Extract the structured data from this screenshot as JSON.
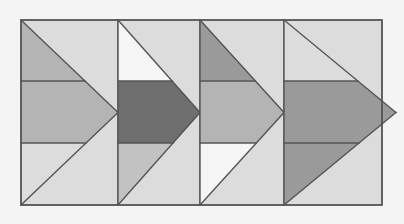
{
  "figure": {
    "canvas": {
      "width": 404,
      "height": 224
    },
    "background_color": "#f4f4f4",
    "stroke_color": "#555555",
    "stroke_width": 1.4,
    "frame": {
      "x": 21,
      "y": 20,
      "width": 361,
      "height": 185
    },
    "band_lines_y": [
      81,
      143
    ],
    "panel_dividers_x": [
      118,
      200,
      284
    ],
    "palette": {
      "white": "#f5f5f5",
      "light": "#dcdcdc",
      "light_mid": "#cccccc",
      "mid": "#b4b4b4",
      "mid_dark": "#9a9a9a",
      "dark": "#6e6e6e"
    }
  },
  "panels": [
    {
      "name": "panel-1",
      "label": "Panel 1",
      "x": 21,
      "width": 97,
      "base_fill": "#dcdcdc",
      "top_fill": "#b4b4b4",
      "middle_fill": "#b4b4b4",
      "bottom_fill": "#dcdcdc",
      "tip_overhang": 0
    },
    {
      "name": "panel-2",
      "label": "Panel 2",
      "x": 118,
      "width": 82,
      "base_fill": "#dcdcdc",
      "top_fill": "#f5f5f5",
      "middle_fill": "#6e6e6e",
      "bottom_fill": "#c2c2c2",
      "tip_overhang": 0
    },
    {
      "name": "panel-3",
      "label": "Panel 3",
      "x": 200,
      "width": 84,
      "base_fill": "#dcdcdc",
      "top_fill": "#9a9a9a",
      "middle_fill": "#b4b4b4",
      "bottom_fill": "#f5f5f5",
      "tip_overhang": 0
    },
    {
      "name": "panel-4",
      "label": "Panel 4",
      "x": 284,
      "width": 98,
      "base_fill": "#dcdcdc",
      "top_fill": "#dcdcdc",
      "middle_fill": "#9a9a9a",
      "bottom_fill": "#9a9a9a",
      "tip_overhang": 14
    }
  ]
}
